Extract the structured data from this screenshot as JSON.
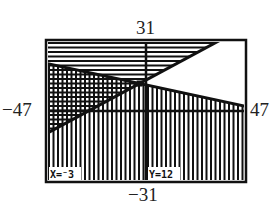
{
  "chart_data": {
    "type": "line",
    "title": "",
    "window": {
      "xmin": -47,
      "xmax": 47,
      "ymin": -31,
      "ymax": 31
    },
    "tick_labels": {
      "top": "31",
      "bottom": "-31",
      "left": "-47",
      "right": "47"
    },
    "series": [
      {
        "name": "Line 1 (rising)",
        "equation": "y = 0.5x + 13.5",
        "slope": 0.5,
        "intercept": 13.5,
        "shade": "above",
        "pattern": "horizontal"
      },
      {
        "name": "Line 2 (falling)",
        "equation": "y = -0.2x + 11.4",
        "slope": -0.2,
        "intercept": 11.4,
        "shade": "below",
        "pattern": "vertical"
      }
    ],
    "cursor": {
      "x": -3,
      "y": 12
    },
    "xlabel": "",
    "ylabel": "",
    "grid": false,
    "axes": true
  },
  "labels": {
    "top": "31",
    "bottom": "−31",
    "left": "−47",
    "right": "47"
  },
  "readout": {
    "x_text": "X=⁻3",
    "y_text": "Y=12"
  },
  "colors": {
    "ink": "#111111",
    "paper": "#ffffff"
  }
}
